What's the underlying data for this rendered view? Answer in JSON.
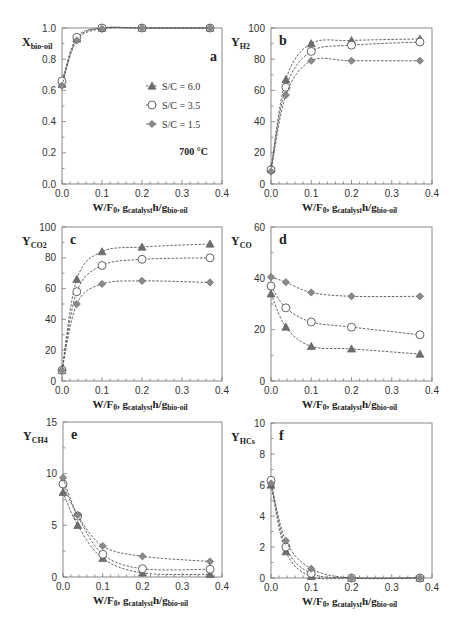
{
  "chart_data": [
    {
      "id": "a",
      "type": "line",
      "panel_letter": "a",
      "ylabel_main": "X",
      "ylabel_sub": "bio-oil",
      "xlabel_main": "W/F",
      "xlabel_sub0": "0",
      "xlabel_mid": ", g",
      "xlabel_sub1": "catalyst",
      "xlabel_mid2": "h/g",
      "xlabel_sub2": "bio-oil",
      "xlim": [
        0,
        0.4
      ],
      "ylim": [
        0,
        1.0
      ],
      "xticks": [
        "0.0",
        "0.1",
        "0.2",
        "0.3",
        "0.4"
      ],
      "yticks": [
        "0.0",
        "0.2",
        "0.4",
        "0.6",
        "0.8",
        "1.0"
      ],
      "annotation": "700 °C",
      "legend": [
        "S/C = 6.0",
        "S/C = 3.5",
        "S/C = 1.5"
      ],
      "x": [
        0.0,
        0.037,
        0.1,
        0.2,
        0.37
      ],
      "series": [
        {
          "name": "S/C = 6.0",
          "marker": "triangle",
          "values": [
            0.64,
            0.93,
            1.0,
            1.0,
            1.0
          ]
        },
        {
          "name": "S/C = 3.5",
          "marker": "circle",
          "values": [
            0.66,
            0.94,
            1.0,
            1.0,
            1.0
          ]
        },
        {
          "name": "S/C = 1.5",
          "marker": "diamond",
          "values": [
            0.63,
            0.92,
            0.995,
            1.0,
            1.0
          ]
        }
      ]
    },
    {
      "id": "b",
      "type": "line",
      "panel_letter": "b",
      "ylabel_main": "Y",
      "ylabel_sub": "H2",
      "xlabel_main": "W/F",
      "xlabel_sub0": "0",
      "xlabel_mid": ", g",
      "xlabel_sub1": "catalyst",
      "xlabel_mid2": "h/g",
      "xlabel_sub2": "bio-oil",
      "xlim": [
        0,
        0.4
      ],
      "ylim": [
        0,
        100
      ],
      "xticks": [
        "0.0",
        "0.1",
        "0.2",
        "0.3",
        "0.4"
      ],
      "yticks": [
        "0",
        "20",
        "40",
        "60",
        "80",
        "100"
      ],
      "x": [
        0.0,
        0.037,
        0.1,
        0.2,
        0.37
      ],
      "series": [
        {
          "name": "S/C = 6.0",
          "marker": "triangle",
          "values": [
            10,
            67,
            90,
            92,
            93
          ]
        },
        {
          "name": "S/C = 3.5",
          "marker": "circle",
          "values": [
            9,
            62,
            85,
            89,
            91
          ]
        },
        {
          "name": "S/C = 1.5",
          "marker": "diamond",
          "values": [
            8,
            57,
            79,
            79,
            79
          ]
        }
      ]
    },
    {
      "id": "c",
      "type": "line",
      "panel_letter": "c",
      "ylabel_main": "Y",
      "ylabel_sub": "CO2",
      "xlabel_main": "W/F",
      "xlabel_sub0": "0",
      "xlabel_mid": ", g",
      "xlabel_sub1": "catalyst",
      "xlabel_mid2": "h/g",
      "xlabel_sub2": "bio-oil",
      "xlim": [
        0,
        0.4
      ],
      "ylim": [
        0,
        100
      ],
      "xticks": [
        "0.0",
        "0.1",
        "0.2",
        "0.3",
        "0.4"
      ],
      "yticks": [
        "0",
        "20",
        "40",
        "60",
        "80",
        "100"
      ],
      "x": [
        0.0,
        0.037,
        0.1,
        0.2,
        0.37
      ],
      "series": [
        {
          "name": "S/C = 6.0",
          "marker": "triangle",
          "values": [
            7,
            66,
            84,
            87,
            89
          ]
        },
        {
          "name": "S/C = 3.5",
          "marker": "circle",
          "values": [
            7,
            58,
            75,
            79,
            80
          ]
        },
        {
          "name": "S/C = 1.5",
          "marker": "diamond",
          "values": [
            7,
            50,
            63,
            65,
            64
          ]
        }
      ]
    },
    {
      "id": "d",
      "type": "line",
      "panel_letter": "d",
      "ylabel_main": "Y",
      "ylabel_sub": "CO",
      "xlabel_main": "W/F",
      "xlabel_sub0": "0",
      "xlabel_mid": ", g",
      "xlabel_sub1": "catalyst",
      "xlabel_mid2": "h/g",
      "xlabel_sub2": "bio-oil",
      "xlim": [
        0,
        0.4
      ],
      "ylim": [
        0,
        60
      ],
      "xticks": [
        "0.0",
        "0.1",
        "0.2",
        "0.3",
        "0.4"
      ],
      "yticks": [
        "0",
        "20",
        "40",
        "60"
      ],
      "x": [
        0.0,
        0.037,
        0.1,
        0.2,
        0.37
      ],
      "series": [
        {
          "name": "S/C = 6.0",
          "marker": "triangle",
          "values": [
            34,
            21,
            13.5,
            12.5,
            10.5
          ]
        },
        {
          "name": "S/C = 3.5",
          "marker": "circle",
          "values": [
            37,
            28.5,
            23,
            21,
            18
          ]
        },
        {
          "name": "S/C = 1.5",
          "marker": "diamond",
          "values": [
            40.5,
            38.5,
            34.5,
            33,
            33
          ]
        }
      ]
    },
    {
      "id": "e",
      "type": "line",
      "panel_letter": "e",
      "ylabel_main": "Y",
      "ylabel_sub": "CH4",
      "xlabel_main": "W/F",
      "xlabel_sub0": "0",
      "xlabel_mid": ", g",
      "xlabel_sub1": "catalyst",
      "xlabel_mid2": "h/g",
      "xlabel_sub2": "bio-oil",
      "xlim": [
        0,
        0.4
      ],
      "ylim": [
        0,
        15
      ],
      "xticks": [
        "0.0",
        "0.1",
        "0.2",
        "0.3",
        "0.4"
      ],
      "yticks": [
        "0",
        "5",
        "10",
        "15"
      ],
      "x": [
        0.0,
        0.037,
        0.1,
        0.2,
        0.37
      ],
      "series": [
        {
          "name": "S/C = 6.0",
          "marker": "triangle",
          "values": [
            8.2,
            5.0,
            1.8,
            0.4,
            0.25
          ]
        },
        {
          "name": "S/C = 3.5",
          "marker": "circle",
          "values": [
            9.0,
            5.9,
            2.2,
            0.8,
            0.75
          ]
        },
        {
          "name": "S/C = 1.5",
          "marker": "diamond",
          "values": [
            9.6,
            6.0,
            3.0,
            2.0,
            1.5
          ]
        }
      ]
    },
    {
      "id": "f",
      "type": "line",
      "panel_letter": "f",
      "ylabel_main": "Y",
      "ylabel_sub": "HCs",
      "xlabel_main": "W/F",
      "xlabel_sub0": "0",
      "xlabel_mid": ", g",
      "xlabel_sub1": "catalyst",
      "xlabel_mid2": "h/g",
      "xlabel_sub2": "bio-oil",
      "xlim": [
        0,
        0.4
      ],
      "ylim": [
        0,
        10
      ],
      "xticks": [
        "0.0",
        "0.1",
        "0.2",
        "0.3",
        "0.4"
      ],
      "yticks": [
        "0",
        "2",
        "4",
        "6",
        "8",
        "10"
      ],
      "x": [
        0.0,
        0.037,
        0.1,
        0.2,
        0.37
      ],
      "series": [
        {
          "name": "S/C = 6.0",
          "marker": "triangle",
          "values": [
            6.0,
            1.7,
            0.1,
            0.0,
            0.0
          ]
        },
        {
          "name": "S/C = 3.5",
          "marker": "circle",
          "values": [
            6.3,
            2.0,
            0.3,
            0.0,
            0.0
          ]
        },
        {
          "name": "S/C = 1.5",
          "marker": "diamond",
          "values": [
            6.1,
            2.4,
            0.6,
            0.0,
            0.0
          ]
        }
      ]
    }
  ],
  "colors": {
    "triangle_fill": "#6e6e6e",
    "circle_fill": "#ffffff",
    "diamond_fill": "#8a8a8a",
    "marker_stroke": "#555555",
    "frame": "#888888"
  }
}
